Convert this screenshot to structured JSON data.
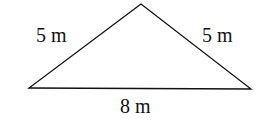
{
  "diagram": {
    "type": "triangle",
    "shape": "isosceles triangle",
    "vertices": {
      "apex": [
        141,
        4
      ],
      "bottom_left": [
        29,
        88
      ],
      "bottom_right": [
        251,
        89
      ]
    },
    "stroke_color": "#111111",
    "labels": {
      "left_side": "5 m",
      "right_side": "5 m",
      "base": "8 m"
    }
  }
}
